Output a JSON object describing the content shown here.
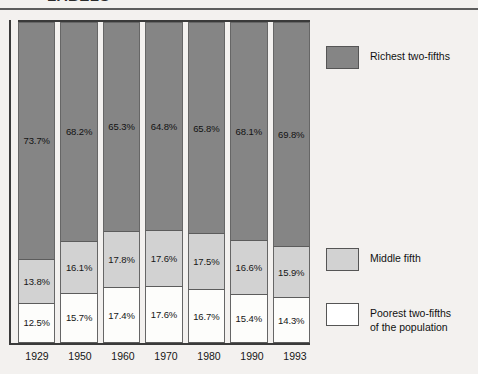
{
  "clipped_title": "LABELS",
  "legend": {
    "items": [
      {
        "key": "rich",
        "label": "Richest two-fifths"
      },
      {
        "key": "mid",
        "label": "Middle fifth"
      },
      {
        "key": "poor",
        "label": "Poorest two-fifths\nof the population"
      }
    ]
  },
  "colors": {
    "richest": "#858585",
    "middle": "#d2d2d2",
    "poorest": "#ffffff",
    "background": "#f3f1ef",
    "axis": "#3a3a3a",
    "rule": "#5d5d5d"
  },
  "chart_data": {
    "type": "bar",
    "stacked": true,
    "title": "",
    "xlabel": "",
    "ylabel": "",
    "ylim": [
      0,
      100
    ],
    "grid": false,
    "legend_position": "right",
    "categories": [
      "1929",
      "1950",
      "1960",
      "1970",
      "1980",
      "1990",
      "1993"
    ],
    "series": [
      {
        "name": "Richest two-fifths",
        "values": [
          73.7,
          68.2,
          65.3,
          64.8,
          65.8,
          68.1,
          69.8
        ],
        "labels": [
          "73.7%",
          "68.2%",
          "65.3%",
          "64.8%",
          "65.8%",
          "68.1%",
          "69.8%"
        ]
      },
      {
        "name": "Middle fifth",
        "values": [
          13.8,
          16.1,
          17.8,
          17.6,
          17.5,
          16.6,
          15.9
        ],
        "labels": [
          "13.8%",
          "16.1%",
          "17.8%",
          "17.6%",
          "17.5%",
          "16.6%",
          "15.9%"
        ]
      },
      {
        "name": "Poorest two-fifths of the population",
        "values": [
          12.5,
          15.7,
          17.4,
          17.6,
          16.7,
          15.4,
          14.3
        ],
        "labels": [
          "12.5%",
          "15.7%",
          "17.4%",
          "17.6%",
          "16.7%",
          "15.4%",
          "14.3%"
        ]
      }
    ]
  }
}
